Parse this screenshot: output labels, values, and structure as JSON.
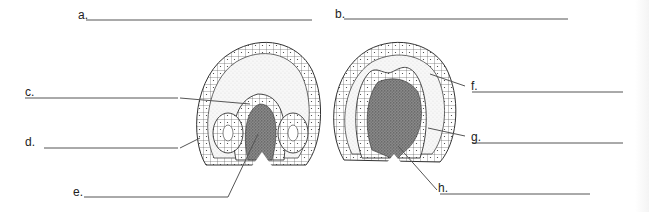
{
  "diagram": {
    "type": "embryo cross-section labeling worksheet",
    "figures": [
      {
        "id": "left",
        "description": "embryo section with two lateral folded tubes and central dense mass"
      },
      {
        "id": "right",
        "description": "embryo section with large central dense mass and two dorsal folds"
      }
    ],
    "labels": [
      {
        "key": "a",
        "text": "a."
      },
      {
        "key": "b",
        "text": "b."
      },
      {
        "key": "c",
        "text": "c."
      },
      {
        "key": "d",
        "text": "d."
      },
      {
        "key": "e",
        "text": "e."
      },
      {
        "key": "f",
        "text": "f."
      },
      {
        "key": "g",
        "text": "g."
      },
      {
        "key": "h",
        "text": "h."
      }
    ],
    "colors": {
      "line": "#555555",
      "outline": "#333333",
      "fill_light": "#f2f2f2",
      "fill_dense": "#6a6a6a"
    }
  }
}
